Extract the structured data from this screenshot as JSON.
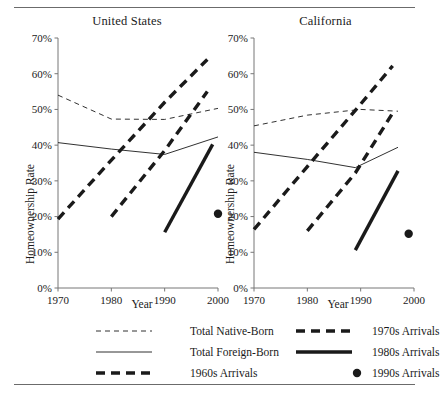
{
  "figure": {
    "has_top_rule": true,
    "has_bottom_rule": true,
    "rule_color": "#6b6b6b",
    "ink_color": "#1a1a1a"
  },
  "panels": [
    {
      "id": "us",
      "title": "United States",
      "xlabel": "Year",
      "ylabel": "Homeownership Rate"
    },
    {
      "id": "ca",
      "title": "California",
      "xlabel": "Year",
      "ylabel": "Homeownership Rate"
    }
  ],
  "axis": {
    "y_ticks": [
      "0%",
      "10%",
      "20%",
      "30%",
      "40%",
      "50%",
      "60%",
      "70%"
    ],
    "x_ticks": [
      "1970",
      "1980",
      "1990",
      "2000"
    ]
  },
  "legend": {
    "items": [
      {
        "label": "Total Native-Born",
        "style": "thin-dashed",
        "name": "total-native-born"
      },
      {
        "label": "1970s Arrivals",
        "style": "thick-dashed",
        "name": "1970s-arrivals"
      },
      {
        "label": "Total Foreign-Born",
        "style": "thin-solid",
        "name": "total-foreign-born"
      },
      {
        "label": "1980s Arrivals",
        "style": "thick-solid",
        "name": "1980s-arrivals"
      },
      {
        "label": "1960s Arrivals",
        "style": "thick-dashed",
        "name": "1960s-arrivals"
      },
      {
        "label": "1990s Arrivals",
        "style": "dot",
        "name": "1990s-arrivals"
      }
    ]
  },
  "chart_data": {
    "type": "line",
    "xlabel": "Year",
    "ylabel": "Homeownership Rate",
    "xlim": [
      1970,
      2000
    ],
    "ylim": [
      0,
      70
    ],
    "y_tick_values": [
      0,
      10,
      20,
      30,
      40,
      50,
      60,
      70
    ],
    "x_tick_values": [
      1970,
      1980,
      1990,
      2000
    ],
    "y_unit": "percent",
    "grid": false,
    "legend_position": "bottom",
    "panels": [
      {
        "name": "United States",
        "series": [
          {
            "name": "Total Native-Born",
            "style": "thin-dashed",
            "x": [
              1970,
              1980,
              1990,
              2000
            ],
            "y": [
              54.0,
              47.3,
              47.2,
              50.3
            ]
          },
          {
            "name": "Total Foreign-Born",
            "style": "thin-solid",
            "x": [
              1970,
              1980,
              1990,
              2000
            ],
            "y": [
              40.7,
              38.9,
              37.4,
              42.3
            ]
          },
          {
            "name": "1960s Arrivals",
            "style": "thick-dashed",
            "x": [
              1970,
              1980,
              1990,
              1998
            ],
            "y": [
              19.3,
              35.8,
              52.0,
              64.0
            ]
          },
          {
            "name": "1970s Arrivals",
            "style": "thick-dashed",
            "x": [
              1980,
              1990,
              1998
            ],
            "y": [
              20.0,
              38.5,
              55.0
            ]
          },
          {
            "name": "1980s Arrivals",
            "style": "thick-solid",
            "x": [
              1990,
              1999
            ],
            "y": [
              15.6,
              40.2
            ]
          },
          {
            "name": "1990s Arrivals",
            "style": "dot",
            "x": [
              2000
            ],
            "y": [
              20.8
            ]
          }
        ]
      },
      {
        "name": "California",
        "series": [
          {
            "name": "Total Native-Born",
            "style": "thin-dashed",
            "x": [
              1970,
              1980,
              1990,
              1997
            ],
            "y": [
              45.4,
              48.4,
              50.0,
              49.5
            ]
          },
          {
            "name": "Total Foreign-Born",
            "style": "thin-solid",
            "x": [
              1970,
              1980,
              1989,
              1997
            ],
            "y": [
              38.0,
              36.0,
              33.7,
              39.4
            ]
          },
          {
            "name": "1960s Arrivals",
            "style": "thick-dashed",
            "x": [
              1970,
              1980,
              1990,
              1996
            ],
            "y": [
              16.4,
              34.0,
              51.5,
              62.2
            ]
          },
          {
            "name": "1970s Arrivals",
            "style": "thick-dashed",
            "x": [
              1980,
              1989,
              1996
            ],
            "y": [
              16.0,
              32.2,
              49.0
            ]
          },
          {
            "name": "1980s Arrivals",
            "style": "thick-solid",
            "x": [
              1989,
              1997
            ],
            "y": [
              10.6,
              32.8
            ]
          },
          {
            "name": "1990s Arrivals",
            "style": "dot",
            "x": [
              1999
            ],
            "y": [
              15.2
            ]
          }
        ]
      }
    ]
  }
}
